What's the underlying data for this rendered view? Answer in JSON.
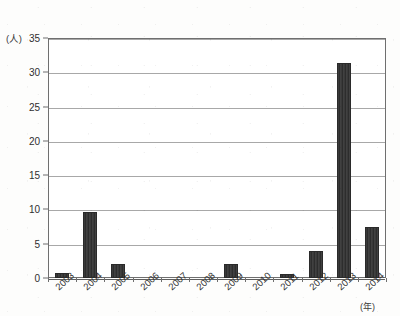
{
  "chart_data": {
    "type": "bar",
    "title": "",
    "subtitle": "",
    "xlabel": "(年)",
    "ylabel": "(人)",
    "categories": [
      "2003",
      "2004",
      "2005",
      "2006",
      "2007",
      "2008",
      "2009",
      "2010",
      "2011",
      "2012",
      "2013",
      "2014"
    ],
    "values": [
      0.7,
      9.7,
      2.1,
      0,
      0,
      0,
      2.0,
      0,
      0.6,
      3.9,
      31.3,
      7.5
    ],
    "ylim": [
      0,
      35
    ],
    "ytick_labels": [
      "0",
      "5",
      "10",
      "15",
      "20",
      "25",
      "30",
      "35"
    ],
    "ytick_values": [
      0,
      5,
      10,
      15,
      20,
      25,
      30,
      35
    ],
    "grid": true,
    "legend": "none",
    "series": [
      {
        "name": "人数",
        "values": [
          0.7,
          9.7,
          2.1,
          0,
          0,
          0,
          2.0,
          0,
          0.6,
          3.9,
          31.3,
          7.5
        ]
      }
    ],
    "bar_color": "#333333",
    "grid_color": "#a8a8a8",
    "axis_color": "#6f6f6f"
  }
}
